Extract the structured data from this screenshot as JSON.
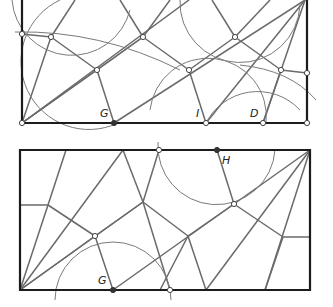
{
  "diagrams": [
    {
      "id": "top",
      "labels": {
        "G": "G",
        "I": "I",
        "D": "D"
      },
      "frame": [
        [
          22,
          0
        ],
        [
          22,
          123
        ],
        [
          307,
          123
        ],
        [
          307,
          0
        ]
      ],
      "creases": [
        [
          [
            22,
            123
          ],
          [
            51,
            37
          ]
        ],
        [
          [
            22,
            123
          ],
          [
            97,
            70
          ]
        ],
        [
          [
            22,
            123
          ],
          [
            143,
            37
          ]
        ],
        [
          [
            22,
            123
          ],
          [
            189,
            0
          ]
        ],
        [
          [
            51,
            37
          ],
          [
            97,
            70
          ]
        ],
        [
          [
            97,
            70
          ],
          [
            143,
            37
          ]
        ],
        [
          [
            143,
            37
          ],
          [
            189,
            70
          ]
        ],
        [
          [
            189,
            70
          ],
          [
            235,
            37
          ]
        ],
        [
          [
            235,
            37
          ],
          [
            281,
            70
          ]
        ],
        [
          [
            97,
            70
          ],
          [
            114,
            123
          ]
        ],
        [
          [
            189,
            70
          ],
          [
            206,
            123
          ]
        ],
        [
          [
            281,
            70
          ],
          [
            263,
            123
          ]
        ],
        [
          [
            114,
            123
          ],
          [
            305,
            0
          ]
        ],
        [
          [
            206,
            123
          ],
          [
            305,
            0
          ]
        ],
        [
          [
            263,
            123
          ],
          [
            305,
            0
          ]
        ],
        [
          [
            51,
            37
          ],
          [
            75,
            0
          ]
        ],
        [
          [
            143,
            37
          ],
          [
            120,
            0
          ]
        ],
        [
          [
            143,
            37
          ],
          [
            170,
            0
          ]
        ],
        [
          [
            235,
            37
          ],
          [
            212,
            0
          ]
        ],
        [
          [
            235,
            37
          ],
          [
            270,
            0
          ]
        ],
        [
          [
            281,
            70
          ],
          [
            307,
            73
          ]
        ],
        [
          [
            51,
            37
          ],
          [
            22,
            34
          ]
        ]
      ],
      "arcs": [
        "M 12 0 A 60 60 0 0 0 130 10",
        "M 60 0 A 58 58 0 0 0 118 123",
        "M 150 110 A 58 58 0 0 1 266 123",
        "M 205 125 A 58 58 0 0 1 300 110",
        "M 180 0 A 60 60 0 0 0 300 5",
        "M 15 32 Q 100 30 180 70",
        "M 240 65 Q 290 70 316 100"
      ],
      "points_open": [
        [
          22,
          34
        ],
        [
          51,
          37
        ],
        [
          97,
          70
        ],
        [
          143,
          37
        ],
        [
          189,
          70
        ],
        [
          235,
          37
        ],
        [
          281,
          70
        ],
        [
          307,
          73
        ],
        [
          22,
          123
        ],
        [
          206,
          123
        ],
        [
          263,
          123
        ],
        [
          307,
          123
        ]
      ],
      "points_dark": [
        [
          114,
          123
        ]
      ],
      "label_pos": {
        "G": [
          100,
          117
        ],
        "I": [
          196,
          117
        ],
        "D": [
          250,
          117
        ]
      }
    },
    {
      "id": "bottom",
      "labels": {
        "G": "G",
        "H": "H"
      },
      "frame": [
        [
          20,
          150
        ],
        [
          310,
          150
        ],
        [
          310,
          290
        ],
        [
          20,
          290
        ]
      ],
      "creases": [
        [
          [
            20,
            205
          ],
          [
            48,
            205
          ]
        ],
        [
          [
            48,
            205
          ],
          [
            66,
            150
          ]
        ],
        [
          [
            48,
            205
          ],
          [
            95,
            236
          ]
        ],
        [
          [
            20,
            290
          ],
          [
            48,
            205
          ]
        ],
        [
          [
            20,
            290
          ],
          [
            123,
            150
          ]
        ],
        [
          [
            20,
            290
          ],
          [
            95,
            236
          ]
        ],
        [
          [
            20,
            290
          ],
          [
            143,
            202
          ]
        ],
        [
          [
            95,
            236
          ],
          [
            113,
            290
          ]
        ],
        [
          [
            95,
            236
          ],
          [
            143,
            202
          ]
        ],
        [
          [
            143,
            202
          ],
          [
            123,
            150
          ]
        ],
        [
          [
            143,
            202
          ],
          [
            159,
            150
          ]
        ],
        [
          [
            143,
            202
          ],
          [
            170,
            290
          ]
        ],
        [
          [
            143,
            202
          ],
          [
            188,
            236
          ]
        ],
        [
          [
            113,
            290
          ],
          [
            234,
            204
          ]
        ],
        [
          [
            217,
            150
          ],
          [
            234,
            204
          ]
        ],
        [
          [
            234,
            204
          ],
          [
            310,
            150
          ]
        ],
        [
          [
            234,
            204
          ],
          [
            283,
            237
          ]
        ],
        [
          [
            188,
            236
          ],
          [
            206,
            290
          ]
        ],
        [
          [
            188,
            236
          ],
          [
            160,
            290
          ]
        ],
        [
          [
            188,
            236
          ],
          [
            234,
            204
          ]
        ],
        [
          [
            283,
            237
          ],
          [
            310,
            237
          ]
        ],
        [
          [
            283,
            237
          ],
          [
            265,
            290
          ]
        ],
        [
          [
            206,
            290
          ],
          [
            310,
            150
          ]
        ],
        [
          [
            265,
            290
          ],
          [
            310,
            150
          ]
        ],
        [
          [
            60,
            150
          ],
          [
            159,
            150
          ]
        ]
      ],
      "arcs": [
        "M 158 142 A 58 58 0 0 0 275 150",
        "M 55 300 A 58 58 0 0 1 171 300"
      ],
      "points_open": [
        [
          159,
          150
        ],
        [
          95,
          236
        ],
        [
          234,
          204
        ],
        [
          170,
          290
        ]
      ],
      "points_dark": [
        [
          217,
          150
        ],
        [
          113,
          290
        ]
      ],
      "label_pos": {
        "G": [
          98,
          284
        ],
        "H": [
          222,
          164
        ]
      }
    }
  ]
}
